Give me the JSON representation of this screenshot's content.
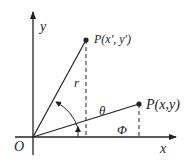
{
  "labels": {
    "y_axis": "y",
    "x_axis": "x",
    "origin": "O",
    "point_rotated": "P(x', y')",
    "point_original": "P(x,y)",
    "radius": "r",
    "theta": "θ",
    "phi": "Φ"
  },
  "colors": {
    "stroke": "#222222",
    "background": "#ffffff"
  }
}
